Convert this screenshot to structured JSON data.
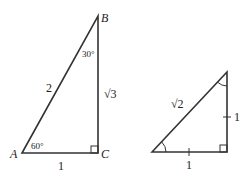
{
  "triangle_30_60_90": {
    "vertices": {
      "A": "A",
      "B": "B",
      "C": "C"
    },
    "angles": {
      "A": "60°",
      "B": "30°"
    },
    "sides": {
      "hypotenuse": "2",
      "vertical": "√3",
      "base": "1"
    }
  },
  "triangle_45_45_90": {
    "sides": {
      "hypotenuse": "√2",
      "vertical": "1",
      "base": "1"
    }
  },
  "colors": {
    "stroke": "#333333",
    "text": "#222222"
  }
}
